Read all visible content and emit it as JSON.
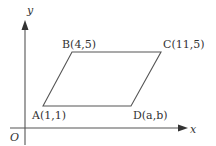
{
  "figure": {
    "type": "coordinate-geometry-diagram",
    "shape": "parallelogram",
    "axes": {
      "x_label": "x",
      "y_label": "y",
      "origin_label": "O"
    },
    "points": [
      {
        "name": "A",
        "coords": "(1,1)",
        "label": "A(1,1)"
      },
      {
        "name": "B",
        "coords": "(4,5)",
        "label": "B(4,5)"
      },
      {
        "name": "C",
        "coords": "(11,5)",
        "label": "C(11,5)"
      },
      {
        "name": "D",
        "coords": "(a,b)",
        "label": "D(a,b)"
      }
    ],
    "colors": {
      "line": "#555555",
      "text": "#333333",
      "background": "#ffffff"
    }
  }
}
